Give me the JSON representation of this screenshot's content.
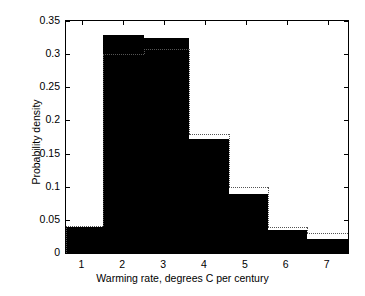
{
  "chart_data": {
    "type": "bar",
    "title": "",
    "subtitle": "",
    "xlabel": "Warming rate, degrees C per century",
    "ylabel": "Probability density",
    "xlim": [
      0.6,
      7.5
    ],
    "ylim": [
      0,
      0.35
    ],
    "grid": false,
    "legend": null,
    "xticks": [
      1,
      2,
      3,
      4,
      5,
      6,
      7
    ],
    "xtick_labels": [
      "1",
      "2",
      "3",
      "4",
      "5",
      "6",
      "7"
    ],
    "yticks": [
      0,
      0.05,
      0.1,
      0.15,
      0.2,
      0.25,
      0.3,
      0.35
    ],
    "ytick_labels": [
      "0",
      "0.05",
      "0.1",
      "0.15",
      "0.2",
      "0.25",
      "0.3",
      "0.35"
    ],
    "bin_edges": [
      0.6,
      1.5,
      2.5,
      3.6,
      4.6,
      5.55,
      6.5,
      7.5
    ],
    "categories": [
      "0.6-1.5",
      "1.5-2.5",
      "2.5-3.6",
      "3.6-4.6",
      "4.6-5.55",
      "5.55-6.5",
      "6.5-7.5"
    ],
    "series": [
      {
        "name": "Histogram (filled)",
        "style": "filled-bars",
        "color": "#000000",
        "values": [
          0.039,
          0.329,
          0.3245,
          0.1725,
          0.0885,
          0.035,
          0.0205
        ]
      },
      {
        "name": "Reference distribution (dotted outline)",
        "style": "dotted-step-outline",
        "color": "#555555",
        "values": [
          0.0405,
          0.3,
          0.3085,
          0.18,
          0.1,
          0.0385,
          0.03
        ]
      }
    ]
  },
  "figure": {
    "background_color": "#ffffff",
    "axes_color": "#000000",
    "bar_color": "#000000",
    "outline_color": "#555555"
  }
}
